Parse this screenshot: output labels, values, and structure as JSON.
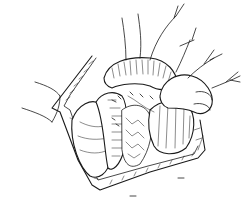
{
  "figure": {
    "type": "line-art surgical illustration",
    "colors": {
      "ink": "#1a1a1a",
      "background": "#ffffff"
    },
    "alt": "Surgical illustration of abdominal incision with hand retracting bowel"
  }
}
